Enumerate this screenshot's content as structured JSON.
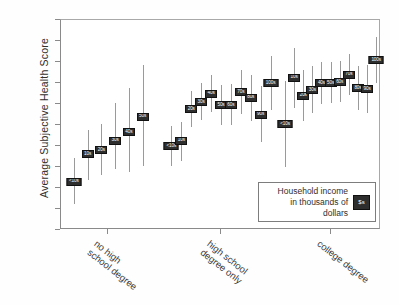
{
  "chart_data": {
    "type": "scatter",
    "title": "",
    "xlabel": "",
    "ylabel": "Average Subjective Health Score",
    "ylim": [
      0.0,
      2.0
    ],
    "ytick_labels": [
      "0.0",
      ".2",
      ".4",
      ".6",
      ".8",
      "1.0",
      "1.2",
      "1.4",
      "1.6",
      "1.8",
      "2.0"
    ],
    "ytick_values": [
      0.0,
      0.2,
      0.4,
      0.6,
      0.8,
      1.0,
      1.2,
      1.4,
      1.6,
      1.8,
      2.0
    ],
    "grid": false,
    "legend": {
      "position": "lower-right-inside",
      "line1": "Household income",
      "line2": "in thousands of dollars",
      "swatch_label": "$s"
    },
    "categories": [
      "no high school degree",
      "high school degree only",
      "college degree"
    ],
    "series_note": "Point estimates with vertical 95% confidence interval whiskers; marker label = household income bracket in thousands of dollars",
    "groups": [
      {
        "category": "no high school degree",
        "points": [
          {
            "label": "<10s",
            "value": 0.46,
            "low": 0.25,
            "high": 0.69
          },
          {
            "label": "10s",
            "value": 0.72,
            "low": 0.48,
            "high": 0.95
          },
          {
            "label": "20s",
            "value": 0.76,
            "low": 0.52,
            "high": 1.01
          },
          {
            "label": "30s",
            "value": 0.85,
            "low": 0.58,
            "high": 1.21
          },
          {
            "label": "40s",
            "value": 0.93,
            "low": 0.55,
            "high": 1.35
          },
          {
            "label": "50s",
            "value": 1.08,
            "low": 0.61,
            "high": 1.57
          }
        ]
      },
      {
        "category": "high school degree only",
        "points": [
          {
            "label": "<10s",
            "value": 0.8,
            "low": 0.61,
            "high": 0.99
          },
          {
            "label": "10s",
            "value": 0.85,
            "low": 0.66,
            "high": 1.03
          },
          {
            "label": "20s",
            "value": 1.15,
            "low": 0.98,
            "high": 1.32
          },
          {
            "label": "30s",
            "value": 1.22,
            "low": 1.05,
            "high": 1.4
          },
          {
            "label": "40s",
            "value": 1.3,
            "low": 1.12,
            "high": 1.48
          },
          {
            "label": "50s",
            "value": 1.19,
            "low": 1.0,
            "high": 1.38
          },
          {
            "label": "60s",
            "value": 1.19,
            "low": 1.0,
            "high": 1.39
          },
          {
            "label": "70s",
            "value": 1.31,
            "low": 1.1,
            "high": 1.52
          },
          {
            "label": "80s",
            "value": 1.26,
            "low": 1.04,
            "high": 1.48
          },
          {
            "label": "90s",
            "value": 1.1,
            "low": 0.84,
            "high": 1.37
          },
          {
            "label": "100s",
            "value": 1.4,
            "low": 1.14,
            "high": 1.66
          }
        ]
      },
      {
        "category": "college degree",
        "points": [
          {
            "label": "<10s",
            "value": 1.01,
            "low": 0.6,
            "high": 1.42
          },
          {
            "label": "10s",
            "value": 1.45,
            "low": 1.16,
            "high": 1.73
          },
          {
            "label": "20s",
            "value": 1.28,
            "low": 1.04,
            "high": 1.52
          },
          {
            "label": "30s",
            "value": 1.33,
            "low": 1.11,
            "high": 1.56
          },
          {
            "label": "40s",
            "value": 1.4,
            "low": 1.2,
            "high": 1.6
          },
          {
            "label": "50s",
            "value": 1.4,
            "low": 1.21,
            "high": 1.6
          },
          {
            "label": "60s",
            "value": 1.41,
            "low": 1.22,
            "high": 1.61
          },
          {
            "label": "70s",
            "value": 1.48,
            "low": 1.29,
            "high": 1.68
          },
          {
            "label": "80s",
            "value": 1.35,
            "low": 1.14,
            "high": 1.56
          },
          {
            "label": "90s",
            "value": 1.34,
            "low": 1.11,
            "high": 1.57
          },
          {
            "label": "100s",
            "value": 1.62,
            "low": 1.4,
            "high": 1.84
          }
        ]
      }
    ]
  }
}
